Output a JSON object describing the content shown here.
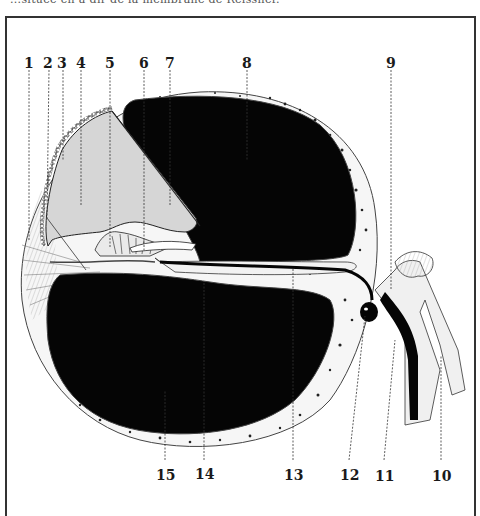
{
  "caption": "...située en a-dir de la membrane de Reissner.",
  "figure": {
    "colors": {
      "background": "#ffffff",
      "fluid_spaces": "#050505",
      "cochlear_duct": "#d6d6d6",
      "bone": "#f4f4f4",
      "lines": "#222222"
    },
    "labels_top": [
      {
        "id": "1",
        "text": "1"
      },
      {
        "id": "2",
        "text": "2"
      },
      {
        "id": "3",
        "text": "3"
      },
      {
        "id": "4",
        "text": "4"
      },
      {
        "id": "5",
        "text": "5"
      },
      {
        "id": "6",
        "text": "6"
      },
      {
        "id": "7",
        "text": "7"
      },
      {
        "id": "8",
        "text": "8"
      },
      {
        "id": "9",
        "text": "9"
      }
    ],
    "labels_bottom": [
      {
        "id": "15",
        "text": "15"
      },
      {
        "id": "14",
        "text": "14"
      },
      {
        "id": "13",
        "text": "13"
      },
      {
        "id": "12",
        "text": "12"
      },
      {
        "id": "11",
        "text": "11"
      },
      {
        "id": "10",
        "text": "10"
      }
    ]
  }
}
